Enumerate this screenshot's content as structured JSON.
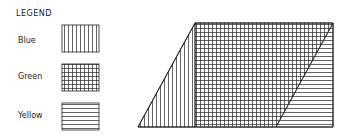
{
  "legend": {
    "title": "LEGEND",
    "items": [
      {
        "label": "Blue",
        "pattern": "vertical-lines"
      },
      {
        "label": "Green",
        "pattern": "grid"
      },
      {
        "label": "Yellow",
        "pattern": "horizontal-lines"
      }
    ]
  },
  "diagram": {
    "shape": "parallelogram",
    "regions": [
      {
        "name": "Blue",
        "pattern": "vertical-lines",
        "shape": "left triangle"
      },
      {
        "name": "Green",
        "pattern": "grid",
        "shape": "central parallelogram"
      },
      {
        "name": "Yellow",
        "pattern": "horizontal-lines",
        "shape": "right triangle"
      }
    ]
  }
}
